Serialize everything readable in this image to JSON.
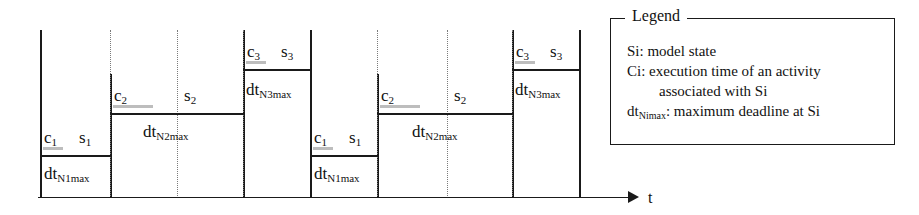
{
  "figure": {
    "type": "timing-state-diagram",
    "axis": {
      "label": "t",
      "label_name": "time-axis-label",
      "arrow_direction": "right"
    },
    "levels": {
      "level_1_label": "c1 / s1 (lowest plateau)",
      "level_2_label": "c2 / s2 (middle plateau)",
      "level_3_label": "c3 / s3 (highest plateau)"
    },
    "blocks": [
      {
        "id": "b1",
        "state": "s1",
        "c_label": "c",
        "c_sub": "1",
        "s_label": "s",
        "s_sub": "1",
        "dt_label": "dt",
        "dt_sub": "N1max"
      },
      {
        "id": "b2",
        "state": "s2",
        "c_label": "c",
        "c_sub": "2",
        "s_label": "s",
        "s_sub": "2",
        "dt_label": "dt",
        "dt_sub": "N2max"
      },
      {
        "id": "b3",
        "state": "s3",
        "c_label": "c",
        "c_sub": "3",
        "s_label": "s",
        "s_sub": "3",
        "dt_label": "dt",
        "dt_sub": "N3max"
      },
      {
        "id": "b4",
        "state": "s1",
        "c_label": "c",
        "c_sub": "1",
        "s_label": "s",
        "s_sub": "1",
        "dt_label": "dt",
        "dt_sub": "N1max"
      },
      {
        "id": "b5",
        "state": "s2",
        "c_label": "c",
        "c_sub": "2",
        "s_label": "s",
        "s_sub": "2",
        "dt_label": "dt",
        "dt_sub": "N2max"
      },
      {
        "id": "b6",
        "state": "s3",
        "c_label": "c",
        "c_sub": "3",
        "s_label": "s",
        "s_sub": "3",
        "dt_label": "dt",
        "dt_sub": "N3max"
      }
    ]
  },
  "legend": {
    "title": "Legend",
    "lines": [
      {
        "text": "Si: model state"
      },
      {
        "text": "Ci: execution time of an activity"
      },
      {
        "text": "associated with Si"
      }
    ],
    "dt_line": {
      "prefix": "dt",
      "sub": "Nimax",
      "suffix": ": maximum deadline at Si"
    }
  },
  "colors": {
    "ink": "#1a1a1a",
    "divider": "#7a7a7a",
    "smudge": "#bdbdbd",
    "background": "#ffffff"
  }
}
